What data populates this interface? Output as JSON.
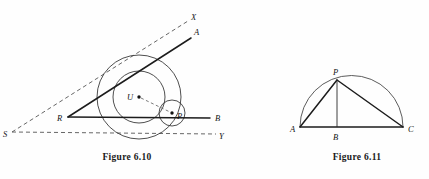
{
  "page": {
    "background_color": "#fefefe",
    "ink_color": "#1c1c1c",
    "width": 429,
    "height": 179
  },
  "figures": [
    {
      "id": "figure-6-10",
      "caption": "Figure 6.10",
      "description": "Angle with inscribed circles tangent to both sides",
      "labels": {
        "S": "S",
        "R": "R",
        "X": "X",
        "Y": "Y",
        "A": "A",
        "B": "B",
        "U": "U",
        "P": "P"
      },
      "points": {
        "S": [
          12,
          132
        ],
        "R": [
          68,
          117
        ],
        "X": [
          188,
          21
        ],
        "Y": [
          216,
          134
        ],
        "A": [
          191,
          38
        ],
        "B": [
          210,
          118
        ],
        "U": [
          139,
          97
        ],
        "P": [
          172,
          113
        ]
      },
      "label_offsets": {
        "S": [
          3,
          137
        ],
        "R": [
          58,
          121
        ],
        "X": [
          191,
          20
        ],
        "Y": [
          219,
          138
        ],
        "A": [
          194,
          34
        ],
        "B": [
          215,
          120
        ],
        "U": [
          128,
          100
        ],
        "P": [
          177,
          118
        ]
      },
      "circles": [
        {
          "name": "large-circle",
          "cx": 139,
          "cy": 97,
          "r": 42
        },
        {
          "name": "medium-circle",
          "cx": 139,
          "cy": 97,
          "r": 26
        },
        {
          "name": "small-circle",
          "cx": 172,
          "cy": 113,
          "r": 13
        }
      ],
      "dashed_rays": [
        {
          "name": "ray-SX",
          "from": [
            12,
            132
          ],
          "to": [
            188,
            21
          ]
        },
        {
          "name": "ray-SY",
          "from": [
            12,
            132
          ],
          "to": [
            216,
            134
          ]
        }
      ],
      "solid_rays": [
        {
          "name": "ray-RA",
          "from": [
            68,
            117
          ],
          "to": [
            191,
            38
          ]
        },
        {
          "name": "ray-RB",
          "from": [
            68,
            117
          ],
          "to": [
            210,
            118
          ]
        }
      ],
      "connector": {
        "name": "segment-UP",
        "from": [
          139,
          97
        ],
        "to": [
          172,
          113
        ]
      }
    },
    {
      "id": "figure-6-11",
      "caption": "Figure 6.11",
      "description": "Semicircle on diameter AC with apex P and altitude PB",
      "labels": {
        "A": "A",
        "B": "B",
        "C": "C",
        "P": "P"
      },
      "points": {
        "A": [
          300,
          127
        ],
        "B": [
          337,
          127
        ],
        "C": [
          403,
          127
        ],
        "P": [
          337,
          80
        ]
      },
      "label_offsets": {
        "A": [
          291,
          131
        ],
        "B": [
          333,
          139
        ],
        "C": [
          408,
          131
        ],
        "P": [
          334,
          74
        ]
      },
      "semicircle": {
        "name": "semicircle-AC",
        "cx": 351.5,
        "cy": 127,
        "r": 51.5
      },
      "segments": [
        {
          "name": "segment-AC",
          "from": [
            300,
            127
          ],
          "to": [
            403,
            127
          ]
        },
        {
          "name": "segment-AP",
          "from": [
            300,
            127
          ],
          "to": [
            337,
            80
          ]
        },
        {
          "name": "segment-PC",
          "from": [
            337,
            80
          ],
          "to": [
            403,
            127
          ]
        },
        {
          "name": "segment-PB",
          "from": [
            337,
            80
          ],
          "to": [
            337,
            127
          ]
        }
      ]
    }
  ]
}
